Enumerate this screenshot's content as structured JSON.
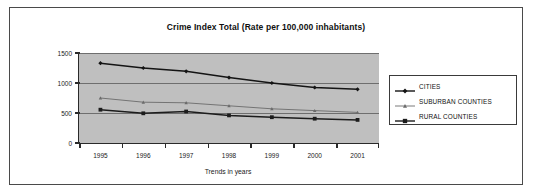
{
  "chart_data": {
    "type": "line",
    "title": "Crime Index Total (Rate per 100,000 inhabitants)",
    "xlabel": "Trends in years",
    "ylabel": "",
    "categories": [
      "1995",
      "1996",
      "1997",
      "1998",
      "1999",
      "2000",
      "2001"
    ],
    "ylim": [
      0,
      1500
    ],
    "yticks": [
      0,
      500,
      1000,
      1500
    ],
    "ytick_labels": [
      "0",
      "500",
      "1000",
      "1500"
    ],
    "grid": true,
    "legend_position": "right",
    "plot_background": "#bfbfbf",
    "series": [
      {
        "name": "CITIES",
        "marker": "diamond",
        "color": "#141414",
        "values": [
          1330,
          1250,
          1195,
          1090,
          1000,
          925,
          895
        ]
      },
      {
        "name": "SUBURBAN COUNTIES",
        "marker": "triangle",
        "color": "#6b6b6b",
        "values": [
          750,
          680,
          670,
          620,
          570,
          540,
          510
        ]
      },
      {
        "name": "RURAL COUNTIES",
        "marker": "square",
        "color": "#1c1c1c",
        "values": [
          555,
          495,
          525,
          460,
          430,
          405,
          385
        ]
      }
    ]
  },
  "legend": {
    "items": [
      {
        "label": "CITIES"
      },
      {
        "label": "SUBURBAN COUNTIES"
      },
      {
        "label": "RURAL COUNTIES"
      }
    ]
  }
}
